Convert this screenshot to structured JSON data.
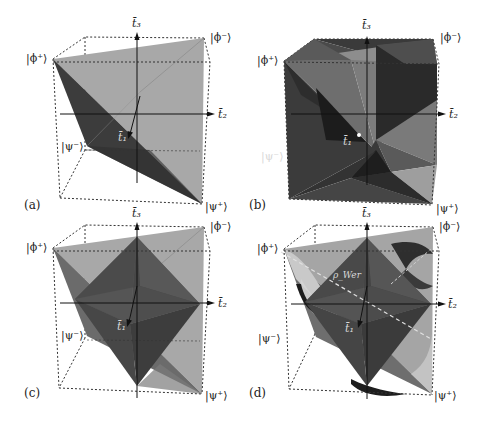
{
  "figure": {
    "panels": [
      {
        "id": "a",
        "tag": "(a)",
        "description": "Tetrahedron of two-qubit Bell-diagonal states",
        "vertices": {
          "phi_plus": "|ϕ⁺⟩",
          "phi_minus": "|ϕ⁻⟩",
          "psi_minus": "|ψ⁻⟩",
          "psi_plus": "|ψ⁺⟩"
        },
        "axes": {
          "t1": "t̄₁",
          "t2": "t̄₂",
          "t3": "t̄₃"
        }
      },
      {
        "id": "b",
        "tag": "(b)",
        "description": "Tetrahedron with its reflected tetrahedron (star / stella octangula)",
        "vertices": {
          "phi_plus": "|ϕ⁺⟩",
          "phi_minus": "|ϕ⁻⟩",
          "psi_minus": "|ψ⁻⟩",
          "psi_plus": "|ψ⁺⟩"
        },
        "axes": {
          "t1": "t̄₁",
          "t2": "t̄₂",
          "t3": "t̄₃"
        }
      },
      {
        "id": "c",
        "tag": "(c)",
        "description": "Tetrahedron with inscribed octahedron of separable states",
        "vertices": {
          "phi_plus": "|ϕ⁺⟩",
          "phi_minus": "|ϕ⁻⟩",
          "psi_minus": "|ψ⁻⟩",
          "psi_plus": "|ψ⁺⟩"
        },
        "axes": {
          "t1": "t̄₁",
          "t2": "t̄₂",
          "t3": "t̄₃"
        }
      },
      {
        "id": "d",
        "tag": "(d)",
        "description": "Tetrahedron, octahedron and curved surfaces with Werner-state line",
        "vertices": {
          "phi_plus": "|ϕ⁺⟩",
          "phi_minus": "|ϕ⁻⟩",
          "psi_minus": "|ψ⁻⟩",
          "psi_plus": "|ψ⁺⟩"
        },
        "axes": {
          "t1": "t̄₁",
          "t2": "t̄₂",
          "t3": "t̄₃"
        },
        "annotation": "ρ_Wer"
      }
    ],
    "colors": {
      "face_light": "#a9a9a9",
      "face_mid": "#7a7a7a",
      "face_dark": "#3e3e3e",
      "face_darker": "#262626",
      "face_highlight": "#c9c9c9",
      "box_dash": "#333333",
      "axis": "#111111"
    }
  }
}
